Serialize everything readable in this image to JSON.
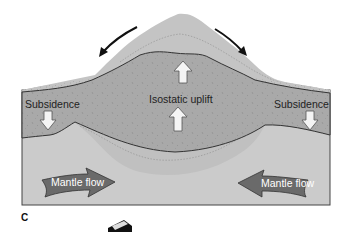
{
  "figure": {
    "panel_label": "C",
    "labels": {
      "isostatic_uplift": "Isostatic uplift",
      "subsidence_left": "Subsidence",
      "subsidence_right": "Subsidence",
      "mantle_flow_left": "Mantle flow",
      "mantle_flow_right": "Mantle flow"
    },
    "colors": {
      "eroding_mountain": "#c4c4c4",
      "crust": "#a9a9a9",
      "sediment": "#bdbdbd",
      "mantle": "#cbcbcb",
      "mantle_root": "#c2c2c2",
      "mantle_flow_arrow": "#6a6a6a",
      "outline": "#333333"
    }
  }
}
